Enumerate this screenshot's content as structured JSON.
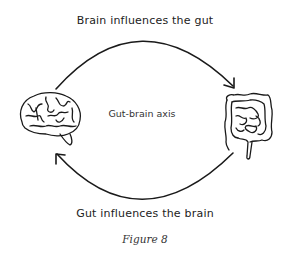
{
  "diagram": {
    "top_label": "Brain influences the gut",
    "center_label": "Gut-brain axis",
    "bottom_label": "Gut influences the brain",
    "caption": "Figure 8",
    "nodes": [
      {
        "id": "brain",
        "icon": "brain-icon"
      },
      {
        "id": "gut",
        "icon": "intestines-icon"
      }
    ],
    "edges": [
      {
        "from": "brain",
        "to": "gut",
        "label": "Brain influences the gut"
      },
      {
        "from": "gut",
        "to": "brain",
        "label": "Gut influences the brain"
      }
    ],
    "colors": {
      "stroke": "#1a1a1a",
      "background": "#ffffff"
    }
  }
}
